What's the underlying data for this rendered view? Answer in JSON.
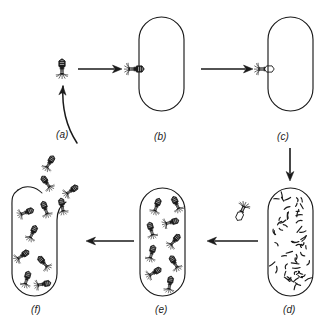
{
  "figure": {
    "background_color": "#ffffff",
    "stroke_color": "#1a1a1a",
    "width": 325,
    "height": 333
  },
  "labels": [
    {
      "name": "label-a",
      "text": "(a)",
      "x": 56,
      "y": 129,
      "stage": "free phage approaches"
    },
    {
      "name": "label-b",
      "text": "(b)",
      "x": 154,
      "y": 131,
      "stage": "phage attaches to bacterium"
    },
    {
      "name": "label-c",
      "text": "(c)",
      "x": 277,
      "y": 131,
      "stage": "phage DNA injected, empty capsid remains"
    },
    {
      "name": "label-d",
      "text": "(d)",
      "x": 283,
      "y": 304,
      "stage": "phage DNA replicated, host DNA degraded"
    },
    {
      "name": "label-e",
      "text": "(e)",
      "x": 155,
      "y": 304,
      "stage": "new phage particles assembled"
    },
    {
      "name": "label-f",
      "text": "(f)",
      "x": 31,
      "y": 304,
      "stage": "cell lyses, phages released"
    }
  ],
  "cells": [
    {
      "name": "bacterium-b",
      "x": 139,
      "y": 17,
      "w": 45,
      "h": 94,
      "contents": "empty",
      "lysed": false
    },
    {
      "name": "bacterium-c",
      "x": 268,
      "y": 17,
      "w": 45,
      "h": 94,
      "contents": "empty",
      "lysed": false
    },
    {
      "name": "bacterium-d",
      "x": 268,
      "y": 188,
      "w": 45,
      "h": 108,
      "contents": "dna-fragments",
      "lysed": false
    },
    {
      "name": "bacterium-e",
      "x": 140,
      "y": 188,
      "w": 45,
      "h": 108,
      "contents": "assembled-phages",
      "lysed": false
    },
    {
      "name": "bacterium-f",
      "x": 12,
      "y": 186,
      "w": 45,
      "h": 110,
      "contents": "assembled-phages",
      "lysed": true
    }
  ],
  "arrows": [
    {
      "name": "arrow-a-to-b",
      "type": "straight",
      "x1": 78,
      "y1": 69,
      "x2": 122,
      "y2": 69
    },
    {
      "name": "arrow-b-to-c",
      "type": "straight",
      "x1": 201,
      "y1": 69,
      "x2": 253,
      "y2": 69
    },
    {
      "name": "arrow-c-to-d",
      "type": "straight",
      "x1": 290,
      "y1": 148,
      "x2": 290,
      "y2": 181
    },
    {
      "name": "arrow-d-to-e",
      "type": "straight",
      "x1": 258,
      "y1": 241,
      "x2": 207,
      "y2": 241
    },
    {
      "name": "arrow-e-to-f",
      "type": "straight",
      "x1": 134,
      "y1": 241,
      "x2": 86,
      "y2": 241
    },
    {
      "name": "arrow-f-to-a",
      "type": "curved",
      "x1": 77,
      "y1": 143,
      "x2": 63,
      "y2": 86
    }
  ],
  "phages": [
    {
      "name": "free-phage-a",
      "x": 62,
      "y": 67,
      "rot": 0,
      "scale": 1.0,
      "state": "full"
    },
    {
      "name": "attached-phage-b",
      "x": 136,
      "y": 69,
      "rot": 90,
      "scale": 1.0,
      "state": "full"
    },
    {
      "name": "empty-capsid-c",
      "x": 266,
      "y": 69,
      "rot": 90,
      "scale": 1.0,
      "state": "empty"
    },
    {
      "name": "free-capsid-d",
      "x": 241,
      "y": 213,
      "rot": 205,
      "scale": 1.0,
      "state": "empty"
    }
  ],
  "cell_e_phages": [
    {
      "x": 157,
      "y": 205,
      "rot": 20
    },
    {
      "x": 176,
      "y": 203,
      "rot": -25
    },
    {
      "x": 172,
      "y": 222,
      "rot": 75
    },
    {
      "x": 151,
      "y": 229,
      "rot": -15
    },
    {
      "x": 175,
      "y": 240,
      "rot": 40
    },
    {
      "x": 152,
      "y": 252,
      "rot": 15
    },
    {
      "x": 174,
      "y": 262,
      "rot": -30
    },
    {
      "x": 155,
      "y": 272,
      "rot": 60
    },
    {
      "x": 170,
      "y": 283,
      "rot": 10
    }
  ],
  "cell_f_phages": [
    {
      "x": 27,
      "y": 212,
      "rot": 70
    },
    {
      "x": 45,
      "y": 208,
      "rot": -20
    },
    {
      "x": 33,
      "y": 232,
      "rot": 25
    },
    {
      "x": 23,
      "y": 255,
      "rot": 55
    },
    {
      "x": 43,
      "y": 262,
      "rot": -40
    },
    {
      "x": 27,
      "y": 278,
      "rot": 15
    },
    {
      "x": 44,
      "y": 284,
      "rot": 80
    }
  ],
  "escaped_phages": [
    {
      "x": 50,
      "y": 162,
      "rot": 30
    },
    {
      "x": 46,
      "y": 182,
      "rot": -35
    },
    {
      "x": 72,
      "y": 190,
      "rot": 55
    },
    {
      "x": 62,
      "y": 205,
      "rot": -10
    }
  ],
  "dna_fragment_count": 58,
  "icons": {
    "phage-icon": "bacteriophage",
    "dna-fragment-icon": "dna-squiggle",
    "bacterium-icon": "capsule-cell",
    "arrow-icon": "arrow-right"
  }
}
